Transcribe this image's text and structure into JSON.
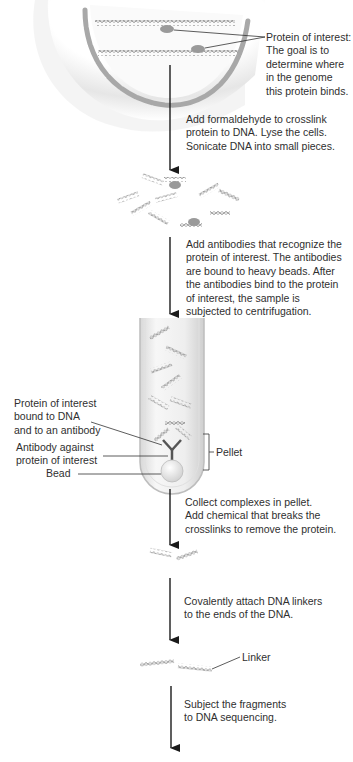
{
  "diagram": {
    "cell_labels": {
      "protein_of_interest": "Protein of interest:\nThe goal is to\ndetermine where\nin the genome\nthis protein binds."
    },
    "steps": [
      {
        "id": "step1",
        "text": "Add formaldehyde to crosslink\nprotein to DNA. Lyse the cells.\nSonicate DNA into small pieces."
      },
      {
        "id": "step2",
        "text": "Add antibodies that recognize the\nprotein of interest. The antibodies\nare bound to heavy beads. After\nthe antibodies bind to the protein\nof interest, the sample is\nsubjected to centrifugation."
      },
      {
        "id": "step3",
        "text": "Collect complexes in pellet.\nAdd chemical that breaks the\ncrosslinks to remove the protein."
      },
      {
        "id": "step4",
        "text": "Covalently attach DNA linkers\nto the ends of the DNA."
      },
      {
        "id": "step5",
        "text": "Subject the fragments\nto DNA sequencing."
      }
    ],
    "tube_labels": {
      "protein_bound": "Protein of interest\nbound to DNA\nand to an antibody",
      "antibody": "Antibody against\nprotein of interest",
      "bead": "Bead",
      "pellet": "Pellet"
    },
    "linker_label": "Linker",
    "colors": {
      "dna": "#8c8c8c",
      "protein": "#9a9a9a",
      "cell_shadow": "#d9d9d9",
      "nucleus_envelope": "#a8a8a8",
      "arrow": "#1a1a1a",
      "text": "#2f2f2f"
    }
  }
}
